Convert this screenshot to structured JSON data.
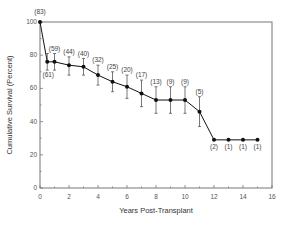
{
  "chart_data": {
    "type": "line",
    "title": "",
    "xlabel": "Years Post-Transplant",
    "ylabel": "Cumulative Survival (Percent)",
    "xlim": [
      0,
      16
    ],
    "ylim": [
      0,
      100
    ],
    "x_ticks": [
      0,
      2,
      4,
      6,
      8,
      10,
      12,
      14,
      16
    ],
    "y_ticks": [
      0,
      20,
      40,
      60,
      80,
      100
    ],
    "grid": false,
    "legend": null,
    "series": [
      {
        "name": "Cumulative Survival",
        "marker": "filled-circle",
        "color": "#111111",
        "x": [
          0,
          0.5,
          1,
          2,
          3,
          4,
          5,
          6,
          7,
          8,
          9,
          10,
          11,
          12,
          13,
          14,
          15
        ],
        "values": [
          100,
          76,
          76,
          74,
          73,
          68,
          64,
          61,
          57,
          53,
          53,
          53,
          46,
          29,
          29,
          29,
          29
        ],
        "error_low": [
          100,
          71,
          71,
          68,
          68,
          62,
          58,
          54,
          49,
          45,
          45,
          45,
          37,
          29,
          29,
          29,
          29
        ],
        "error_high": [
          100,
          81,
          81,
          79,
          78,
          74,
          70,
          68,
          65,
          61,
          61,
          61,
          55,
          29,
          29,
          29,
          29
        ],
        "n_at_risk": [
          "(83)",
          "(61)",
          "(59)",
          "(44)",
          "(40)",
          "(32)",
          "(25)",
          "(20)",
          "(17)",
          "(13)",
          "(9)",
          "(9)",
          "(5)",
          "(2)",
          "(1)",
          "(1)",
          "(1)"
        ],
        "n_label_position": [
          "above",
          "below",
          "above",
          "above",
          "above",
          "above",
          "above",
          "above",
          "above",
          "above",
          "above",
          "above",
          "above",
          "below",
          "below",
          "below",
          "below"
        ]
      }
    ]
  }
}
